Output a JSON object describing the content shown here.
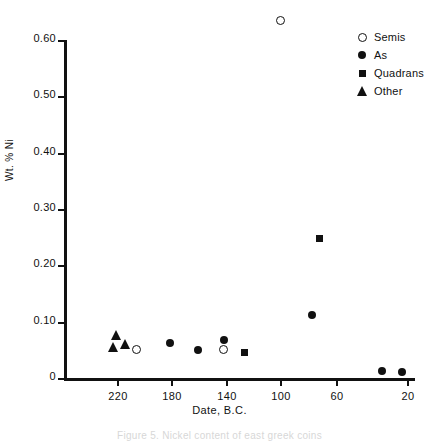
{
  "chart_data": {
    "type": "scatter",
    "title": "",
    "xlabel": "Date, B.C.",
    "ylabel": "Wt. % Ni",
    "xticks": [
      220,
      180,
      140,
      100,
      60,
      20
    ],
    "yticks": [
      "0.60",
      "0.50",
      "0.40",
      "0.30",
      "0.20",
      "0.10",
      "0"
    ],
    "xlim": [
      240,
      12
    ],
    "ylim": [
      0,
      0.6
    ],
    "x_axis_reversed": true,
    "grid": false,
    "legend_position": "top-right",
    "legend": [
      {
        "label": "Semis",
        "marker": "circle-open"
      },
      {
        "label": "As",
        "marker": "circle-filled"
      },
      {
        "label": "Quadrans",
        "marker": "square-filled"
      },
      {
        "label": "Other",
        "marker": "triangle-filled"
      }
    ],
    "series": [
      {
        "name": "Semis",
        "marker": "circle-open",
        "points": [
          {
            "x": 207,
            "y": 0.05
          },
          {
            "x": 147,
            "y": 0.05
          },
          {
            "x": 108,
            "y": 0.635
          }
        ]
      },
      {
        "name": "As",
        "marker": "circle-filled",
        "points": [
          {
            "x": 184,
            "y": 0.062
          },
          {
            "x": 165,
            "y": 0.05
          },
          {
            "x": 147,
            "y": 0.068
          },
          {
            "x": 86,
            "y": 0.112
          },
          {
            "x": 38,
            "y": 0.012
          },
          {
            "x": 24,
            "y": 0.01
          }
        ]
      },
      {
        "name": "Quadrans",
        "marker": "square-filled",
        "points": [
          {
            "x": 133,
            "y": 0.046
          },
          {
            "x": 81,
            "y": 0.248
          }
        ]
      },
      {
        "name": "Other",
        "marker": "triangle-filled",
        "points": [
          {
            "x": 221,
            "y": 0.076
          },
          {
            "x": 223,
            "y": 0.055
          },
          {
            "x": 215,
            "y": 0.06
          }
        ]
      }
    ]
  },
  "caption": "Figure 5. Nickel content of east greek coins"
}
